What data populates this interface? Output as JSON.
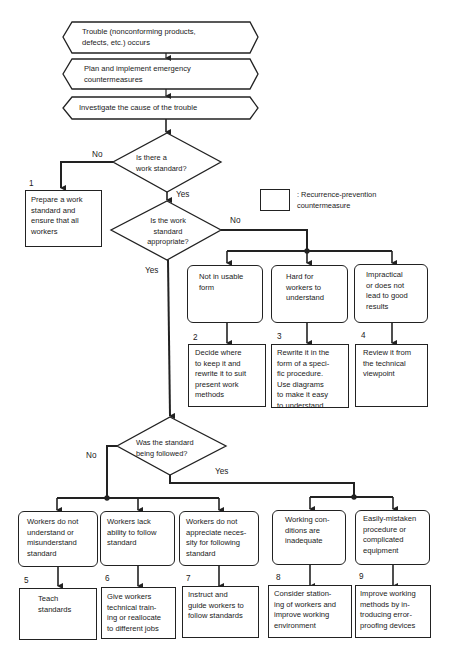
{
  "flowchart": {
    "start_steps": [
      {
        "id": "trouble",
        "text": "Trouble (nonconforming products,\ndefects, etc.) occurs"
      },
      {
        "id": "emergency",
        "text": "Plan and implement emergency\ncountermeasures"
      },
      {
        "id": "investigate",
        "text": "Investigate the cause of the trouble"
      }
    ],
    "decisions": [
      {
        "id": "has-standard",
        "text": "Is there a\nwork standard?",
        "yes": "Yes",
        "no": "No"
      },
      {
        "id": "standard-appropriate",
        "text": "Is the work\nstandard\nappropriate?",
        "yes": "Yes",
        "no": "No"
      },
      {
        "id": "standard-followed",
        "text": "Was the standard\nbeing followed?",
        "yes": "Yes",
        "no": "No"
      }
    ],
    "legend": {
      "text": ": Recurrence-prevention\n  countermeasure"
    },
    "countermeasures": [
      {
        "number": "1",
        "text": "Prepare a work\nstandard and\nensure that all\nworkers"
      },
      {
        "number": "2",
        "text": "Decide where\nto keep it and\nrewrite it to suit\npresent work\nmethods"
      },
      {
        "number": "3",
        "text": "Rewrite it in the\nform of a speci-\nfic procedure.\nUse diagrams\nto make it easy\nto understand"
      },
      {
        "number": "4",
        "text": "Review it from\nthe technical\nviewpoint"
      },
      {
        "number": "5",
        "text": "Teach\nstandards"
      },
      {
        "number": "6",
        "text": "Give workers\ntechnical train-\ning or reallocate\nto different jobs"
      },
      {
        "number": "7",
        "text": "Instruct and\nguide workers to\nfollow standards"
      },
      {
        "number": "8",
        "text": "Consider station-\ning of workers and\nimprove working\nenvironment"
      },
      {
        "number": "9",
        "text": "Improve working\nmethods by in-\ntroducing error-\nproofing devices"
      }
    ],
    "causes_inappropriate": [
      {
        "text": "Not in usable\nform"
      },
      {
        "text": "Hard for\nworkers to\nunderstand"
      },
      {
        "text": "Impractical\nor does not\nlead to good\nresults"
      }
    ],
    "causes_not_followed": [
      {
        "text": "Workers do not\nunderstand or\nmisunderstand\nstandard"
      },
      {
        "text": "Workers lack\nability to follow\nstandard"
      },
      {
        "text": "Workers do not\nappreciate neces-\nsity for following\nstandard"
      },
      {
        "text": "Working con-\nditions are\ninadequate"
      },
      {
        "text": "Easily-mistaken\nprocedure or\ncomplicated\nequipment"
      }
    ]
  },
  "colors": {
    "line": "#222222",
    "background": "#ffffff",
    "text": "#1a1a1a"
  }
}
